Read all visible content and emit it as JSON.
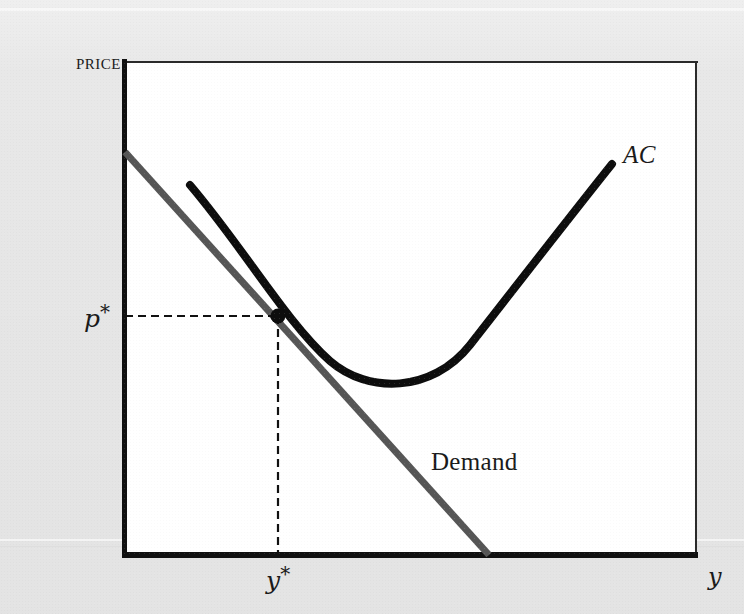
{
  "figure": {
    "kind": "economics-diagram",
    "background_color": "#e8e8e8",
    "plot_background_color": "#ffffff"
  },
  "axes": {
    "y_axis_label": "PRICE",
    "x_axis_label": "y",
    "axis_color": "#111111",
    "frame_color": "#2b2b2b"
  },
  "labels": {
    "price": "PRICE",
    "p_star_base": "p",
    "p_star_mark": "*",
    "y_star_base": "y",
    "y_star_mark": "*",
    "average_cost": "AC",
    "demand": "Demand",
    "x_axis": "y"
  },
  "series": {
    "average_cost": {
      "name": "AC",
      "color": "#0d0d0d",
      "stroke_width": 8,
      "shape": "u-shaped average cost curve",
      "path": "M 190 185 C 243 247, 286 322, 330 361 C 368 394, 432 393, 470 345 C 520 281, 572 214, 612 164",
      "minimum_point": [
        400,
        385
      ],
      "left_endpoint": [
        190,
        185
      ],
      "right_endpoint": [
        612,
        164
      ]
    },
    "demand": {
      "name": "Demand",
      "color": "#565656",
      "stroke_width": 7,
      "shape": "downward sloping straight line",
      "path": "M 125 152 L 489 555",
      "start_point": [
        125,
        152
      ],
      "end_point": [
        489,
        555
      ]
    }
  },
  "equilibrium": {
    "point_label": "tangency point",
    "point_color": "#0d0d0d",
    "point_radius": 7,
    "point_xy": [
      278,
      316
    ],
    "price_value_label": "p*",
    "quantity_value_label": "y*",
    "guide_line_color": "#111111",
    "guide_line_style": "dashed",
    "horizontal_guide": {
      "x1": 125,
      "y1": 316,
      "x2": 278,
      "y2": 316
    },
    "vertical_guide": {
      "x1": 278,
      "y1": 316,
      "x2": 278,
      "y2": 555
    }
  },
  "chart_data": {
    "type": "line",
    "title": "",
    "xlabel": "y",
    "ylabel": "PRICE",
    "grid": false,
    "legend": "inline-annotations",
    "annotations": [
      "AC",
      "Demand",
      "p*",
      "y*"
    ],
    "series": [
      {
        "name": "AC",
        "style": "curve",
        "color": "#0d0d0d",
        "points": [
          [
            190,
            185
          ],
          [
            220,
            220
          ],
          [
            250,
            258
          ],
          [
            280,
            296
          ],
          [
            310,
            332
          ],
          [
            340,
            363
          ],
          [
            370,
            379
          ],
          [
            400,
            385
          ],
          [
            430,
            377
          ],
          [
            460,
            356
          ],
          [
            490,
            325
          ],
          [
            520,
            288
          ],
          [
            550,
            246
          ],
          [
            580,
            204
          ],
          [
            612,
            164
          ]
        ]
      },
      {
        "name": "Demand",
        "style": "line",
        "color": "#565656",
        "points": [
          [
            125,
            152
          ],
          [
            200,
            235
          ],
          [
            278,
            316
          ],
          [
            360,
            407
          ],
          [
            430,
            484
          ],
          [
            489,
            555
          ]
        ]
      }
    ],
    "markers": [
      {
        "label": "p*",
        "x": 278,
        "y": 316,
        "note": "tangency of Demand and AC"
      }
    ],
    "xlim": [
      125,
      697
    ],
    "ylim": [
      557,
      62
    ]
  }
}
